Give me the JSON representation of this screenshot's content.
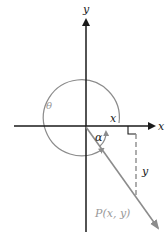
{
  "diagram": {
    "labels": {
      "y_axis": "y",
      "x_axis": "x",
      "theta": "θ",
      "alpha": "α",
      "x_segment": "x",
      "y_segment": "y",
      "point": "P(x, y)"
    },
    "colors": {
      "axis": "#1a1a1a",
      "gray": "#8c8c8c",
      "label_gray": "#999999"
    }
  }
}
